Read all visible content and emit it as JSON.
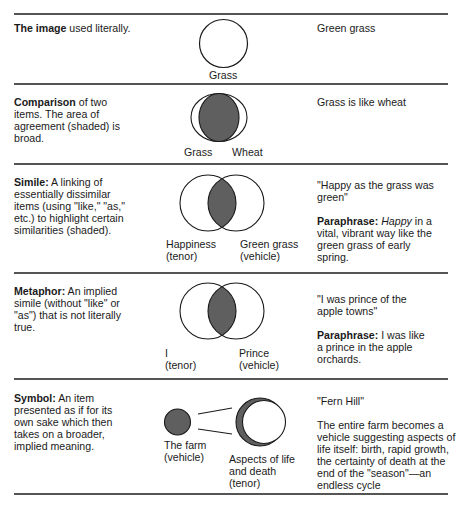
{
  "colors": {
    "rule": "#555555",
    "shade": "#5f5f5f",
    "stroke": "#1a1a1a",
    "text": "#1a1a1a"
  },
  "rows": [
    {
      "id": "image",
      "term": "The image",
      "definition": " used literally.",
      "diagram": {
        "type": "single-circle",
        "labels": [
          "Grass"
        ]
      },
      "example": "Green grass"
    },
    {
      "id": "comparison",
      "term": "Comparison",
      "definition": " of two items. The area of agreement (shaded) is broad.",
      "diagram": {
        "type": "broad-overlap",
        "labels": [
          "Grass",
          "Wheat"
        ]
      },
      "example": "Grass is like wheat"
    },
    {
      "id": "simile",
      "term": "Simile:",
      "definition": " A linking of essentially dissimilar items (using \"like,\" \"as,\" etc.) to highlight certain similarities (shaded).",
      "diagram": {
        "type": "narrow-overlap",
        "labels": [
          {
            "name": "Happiness",
            "role": "(tenor)"
          },
          {
            "name": "Green grass",
            "role": "(vehicle)"
          }
        ]
      },
      "example": "\"Happy as the grass was green\"",
      "paraphrase_label": "Paraphrase:",
      "paraphrase_italic": " Happy",
      "paraphrase_text": " in a vital, vibrant way like the green grass of early spring."
    },
    {
      "id": "metaphor",
      "term": "Metaphor:",
      "definition": " An implied simile (without \"like\" or \"as\") that is not literally true.",
      "diagram": {
        "type": "narrow-overlap",
        "labels": [
          {
            "name": "I",
            "role": "(tenor)"
          },
          {
            "name": "Prince",
            "role": "(vehicle)"
          }
        ]
      },
      "example": "\"I was prince of the apple towns\"",
      "paraphrase_label": "Paraphrase:",
      "paraphrase_text": " I was like a prince in the apple orchards."
    },
    {
      "id": "symbol",
      "term": "Symbol:",
      "definition": "  An item presented as if for its own sake which then takes on a broader, implied meaning.",
      "diagram": {
        "type": "symbol",
        "labels": [
          {
            "name": "The farm",
            "role": "(vehicle)"
          },
          {
            "name": "Aspects of life and death",
            "role": "(tenor)"
          }
        ]
      },
      "example": "\"Fern Hill\"",
      "explanation": "The entire farm becomes a vehicle suggesting aspects of life itself: birth, rapid growth, the certainty of death at the end of the \"season\"—an endless cycle"
    }
  ]
}
